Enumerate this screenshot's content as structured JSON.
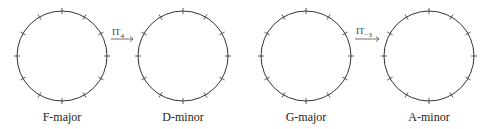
{
  "circles": [
    {
      "id": "f-major",
      "label": "F-major",
      "cx": 62,
      "cy": 56,
      "r": 45
    },
    {
      "id": "d-minor",
      "label": "D-minor",
      "cx": 183,
      "cy": 56,
      "r": 45
    },
    {
      "id": "g-major",
      "label": "G-major",
      "cx": 306,
      "cy": 56,
      "r": 45
    },
    {
      "id": "a-minor",
      "label": "A-minor",
      "cx": 429,
      "cy": 56,
      "r": 45
    }
  ],
  "ticks_per_circle": 12,
  "arrows": [
    {
      "from": "F-major",
      "to": "D-minor",
      "symbol": "IT",
      "subscript": "4"
    },
    {
      "from": "G-major",
      "to": "A-minor",
      "symbol": "IT",
      "subscript": "−3"
    }
  ],
  "colors": {
    "stroke": "#333333",
    "text": "#222222"
  }
}
